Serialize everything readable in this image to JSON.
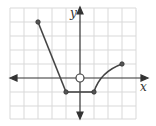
{
  "figure": {
    "type": "function-graph",
    "axes": {
      "x_label": "x",
      "y_label": "y",
      "origin_px": [
        80,
        78
      ],
      "unit_px": 14,
      "x_range": [
        -5,
        4
      ],
      "y_range": [
        -3,
        5
      ]
    },
    "grid": {
      "visible": true,
      "color": "#d9d9d9"
    },
    "colors": {
      "curve": "#444444",
      "axis": "#333333"
    },
    "segments": [
      {
        "kind": "line",
        "from": [
          -3,
          4
        ],
        "to": [
          -1,
          -1
        ]
      },
      {
        "kind": "line",
        "from": [
          -1,
          -1
        ],
        "to": [
          1,
          -1
        ]
      },
      {
        "kind": "curve",
        "from": [
          1,
          -1
        ],
        "to": [
          3,
          1
        ],
        "shape": "concave-down"
      }
    ],
    "closed_points": [
      [
        -3,
        4
      ],
      [
        -1,
        -1
      ],
      [
        1,
        -1
      ],
      [
        3,
        1
      ]
    ],
    "open_points": [
      [
        0,
        0
      ]
    ]
  }
}
